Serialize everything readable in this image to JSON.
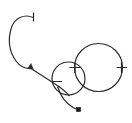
{
  "figure": {
    "background_color": "#ffffff",
    "stroke_color": "#2b2b2f",
    "marker_color": "#1e1e22",
    "canvas": {
      "width": 132,
      "height": 123
    },
    "elements": [
      {
        "id": "open-arc-c",
        "name": "c-shaped-open-arc",
        "kind": "arc",
        "stroke_width": 1.2,
        "path": "M 33.5 17.5 C 24 13.5 14.5 18 11.5 27.5 C 7.5 40 9.5 52 16 61 C 20 66.5 26 69 31.5 68.5"
      },
      {
        "id": "connector-curve",
        "name": "connector-curve-to-small-circle",
        "kind": "curve",
        "stroke_width": 1.2,
        "path": "M 32.5 69.5 C 41 75 50 80.5 58 86 C 63 89.5 67 93 69.5 96"
      },
      {
        "id": "small-circle",
        "name": "small-circle",
        "kind": "circle",
        "stroke_width": 1.2,
        "cx": 68.5,
        "cy": 78.5,
        "r": 16.5
      },
      {
        "id": "large-circle",
        "name": "large-circle",
        "kind": "circle",
        "stroke_width": 1.2,
        "cx": 98.5,
        "cy": 67.5,
        "r": 24.0
      },
      {
        "id": "tail-curve",
        "name": "tail-curve-to-dot",
        "kind": "curve",
        "stroke_width": 1.2,
        "path": "M 57.5 86.5 C 60.5 96 65.5 103 73 107.5 C 75 108.6 76.5 109.1 78 109.4"
      }
    ],
    "ticks": [
      {
        "id": "tick-arc-end",
        "name": "tick-arc-start-cap",
        "x1": 33.5,
        "y1": 12.5,
        "x2": 33.5,
        "y2": 21.5,
        "stroke_width": 1.2
      },
      {
        "id": "tick-circle-left",
        "name": "tick-large-circle-left",
        "x1": 75.0,
        "y1": 62.5,
        "x2": 75.0,
        "y2": 73.0,
        "stroke_width": 1.2
      },
      {
        "id": "tick-circle-right",
        "name": "tick-large-circle-right",
        "x1": 121.5,
        "y1": 62.0,
        "x2": 121.5,
        "y2": 73.0,
        "stroke_width": 1.2
      },
      {
        "id": "tick-circle-left-h",
        "name": "tick-large-circle-left-horizontal",
        "x1": 69.5,
        "y1": 67.5,
        "x2": 80.5,
        "y2": 67.5,
        "stroke_width": 1.0
      },
      {
        "id": "tick-circle-right-h",
        "name": "tick-large-circle-right-horizontal",
        "x1": 116.5,
        "y1": 67.5,
        "x2": 127.0,
        "y2": 67.5,
        "stroke_width": 1.0
      },
      {
        "id": "tick-small-circle-left",
        "name": "tick-small-circle-left-horizontal",
        "x1": 52.0,
        "y1": 81.5,
        "x2": 62.0,
        "y2": 81.5,
        "stroke_width": 1.0
      }
    ],
    "arrow_heads": [
      {
        "id": "arrow-mid",
        "name": "arrowhead-midpoint",
        "points": "31.0,63.5 33.5,70.0 28.0,68.0",
        "stroke_width": 0.5
      }
    ],
    "markers": [
      {
        "id": "end-dot",
        "name": "terminal-dot-marker",
        "shape": "square",
        "cx": 78.5,
        "cy": 109.5,
        "size": 4.2
      }
    ]
  }
}
